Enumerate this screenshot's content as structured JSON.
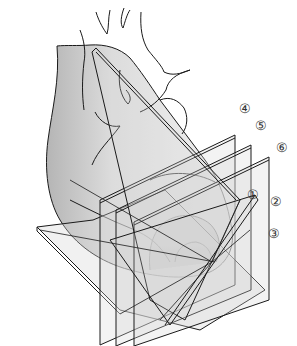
{
  "diagram": {
    "planes": [
      {
        "id": 1,
        "label": "①",
        "orientation": "oblique"
      },
      {
        "id": 2,
        "label": "②",
        "orientation": "oblique"
      },
      {
        "id": 3,
        "label": "③",
        "orientation": "oblique horizontal"
      },
      {
        "id": 4,
        "label": "④",
        "orientation": "vertical"
      },
      {
        "id": 5,
        "label": "⑤",
        "orientation": "vertical"
      },
      {
        "id": 6,
        "label": "⑥",
        "orientation": "vertical"
      }
    ],
    "colors": {
      "stroke": "#1a1a1a",
      "plane_fill": "#d9d9d9",
      "heart_shade": "#c8c8c8",
      "background": "#ffffff"
    }
  }
}
